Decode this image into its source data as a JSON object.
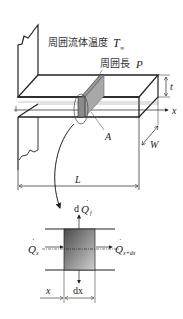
{
  "labels": {
    "ambient_temp_jp": "周囲流体温度",
    "ambient_temp_sym": "T",
    "ambient_temp_sub": "∞",
    "perimeter_jp": "周囲長",
    "perimeter_sym": "P",
    "thickness_sym": "t",
    "axis_x": "x",
    "area_sym": "A",
    "width_sym": "W",
    "length_sym": "L",
    "conv_d": "d",
    "conv_q": "Q",
    "conv_sub": "f",
    "q_in": "Q",
    "q_in_sub": "x",
    "q_out": "Q",
    "q_out_sub": "x+dx",
    "dim_x": "x",
    "dim_dx": "dx"
  },
  "colors": {
    "line": "#222222",
    "shade_dark": "#5a5a5a",
    "shade_light": "#c8c8c8",
    "slice": "#8a8a8a"
  }
}
